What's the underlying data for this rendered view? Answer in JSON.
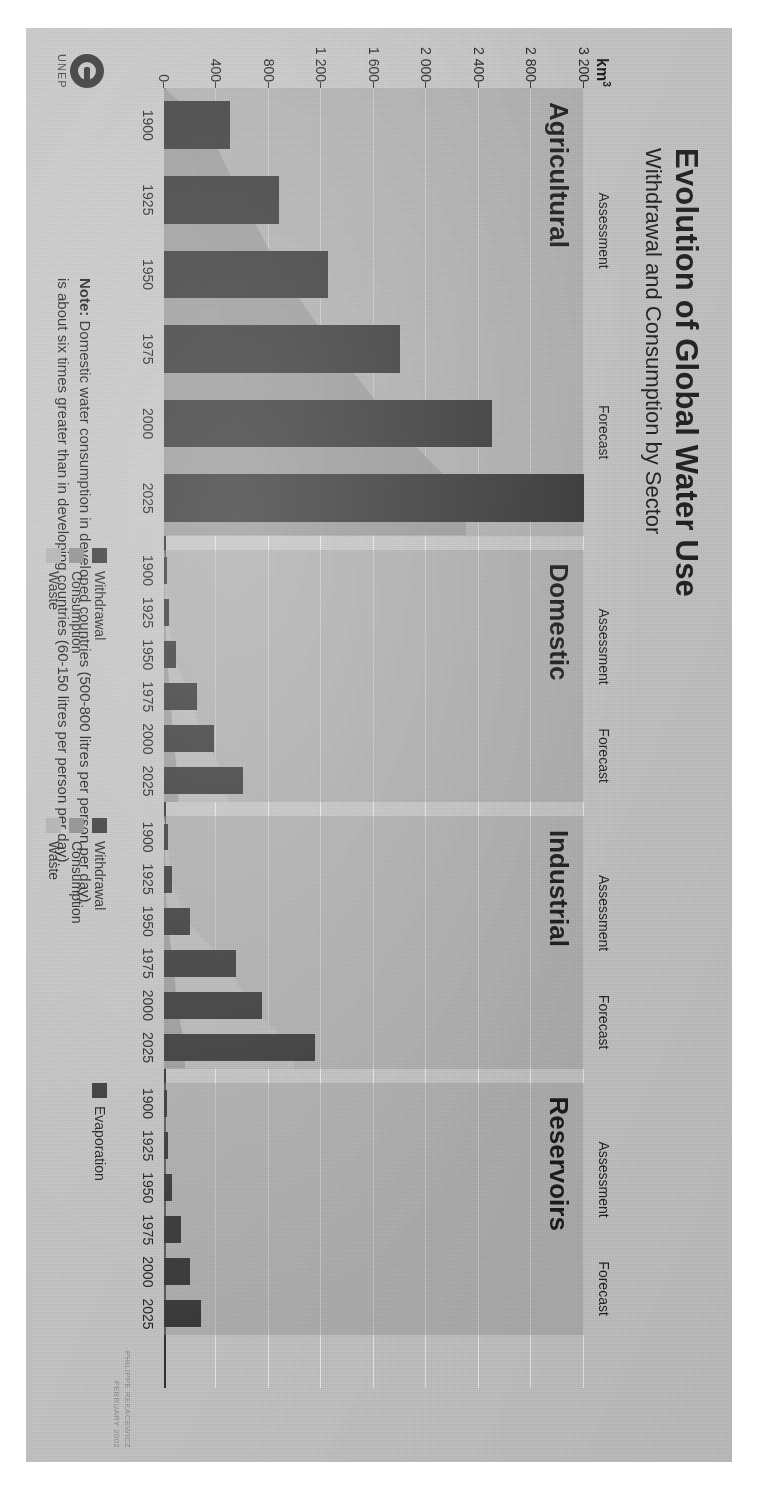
{
  "title": "Evolution of Global Water Use",
  "subtitle": "Withdrawal and Consumption by Sector",
  "axis_unit": "km",
  "axis_unit_exp": "3",
  "note_label": "Note:",
  "note_line1": " Domestic water consumption in developed countries (500-800 litres per person per day)",
  "note_line2": "is about six times greater than in developing countries (60-150 litres per person per day).",
  "credit_line1": "PHILIPPE REKACEWICZ",
  "credit_line2": "FEBRUARY 2002",
  "logo_text": "UNEP",
  "phases": {
    "assessment": "Assessment",
    "forecast": "Forecast"
  },
  "legend_sector": [
    {
      "label": "Withdrawal",
      "color": "#343434"
    },
    {
      "label": "Consumption",
      "color": "#8d8d8d"
    },
    {
      "label": "Waste",
      "color": "#b4b4b4"
    }
  ],
  "legend_reservoirs": [
    {
      "label": "Evaporation",
      "color": "#343434"
    }
  ],
  "chart_data": {
    "type": "bar",
    "title": "Evolution of Global Water Use",
    "subtitle": "Withdrawal and Consumption by Sector",
    "ylabel": "km3",
    "ylim": [
      0,
      3200
    ],
    "yticks": [
      0,
      400,
      800,
      1200,
      1600,
      2000,
      2400,
      2800,
      3200
    ],
    "ytick_labels": [
      "0",
      "400",
      "800",
      "1 200",
      "1 600",
      "2 000",
      "2 400",
      "2 800",
      "3 200"
    ],
    "grid": true,
    "legend_position": "bottom-right",
    "x": [
      1900,
      1925,
      1950,
      1975,
      2000,
      2025
    ],
    "xtick_labels": [
      "1900",
      "1925",
      "1950",
      "1975",
      "2000",
      "2025"
    ],
    "phase_split_year": 2000,
    "panels": [
      {
        "name": "Agricultural",
        "series": [
          {
            "name": "Withdrawal",
            "values": [
              500,
              880,
              1250,
              1800,
              2500,
              3200
            ]
          },
          {
            "name": "Consumption",
            "values": [
              320,
              600,
              900,
              1300,
              1750,
              2300
            ]
          },
          {
            "name": "Waste",
            "values": [
              180,
              280,
              350,
              500,
              750,
              900
            ]
          }
        ]
      },
      {
        "name": "Domestic",
        "series": [
          {
            "name": "Withdrawal",
            "values": [
              20,
              40,
              90,
              250,
              380,
              600
            ]
          },
          {
            "name": "Consumption",
            "values": [
              5,
              10,
              20,
              50,
              70,
              110
            ]
          },
          {
            "name": "Waste",
            "values": [
              15,
              30,
              70,
              200,
              310,
              490
            ]
          }
        ]
      },
      {
        "name": "Industrial",
        "series": [
          {
            "name": "Withdrawal",
            "values": [
              30,
              60,
              200,
              550,
              750,
              1150
            ]
          },
          {
            "name": "Consumption",
            "values": [
              5,
              10,
              25,
              70,
              100,
              160
            ]
          },
          {
            "name": "Waste",
            "values": [
              25,
              50,
              175,
              480,
              650,
              990
            ]
          }
        ]
      },
      {
        "name": "Reservoirs",
        "series": [
          {
            "name": "Evaporation",
            "values": [
              10,
              30,
              60,
              130,
              200,
              280
            ]
          }
        ]
      }
    ]
  }
}
